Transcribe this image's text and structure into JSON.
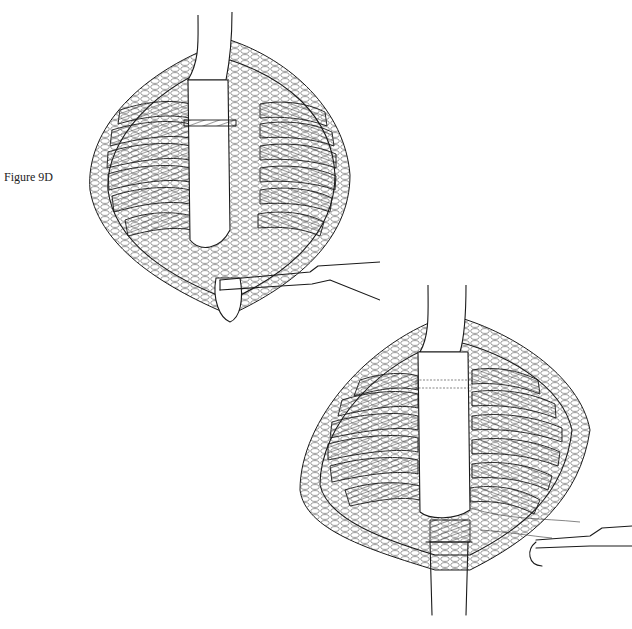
{
  "figure": {
    "caption": "Figure 9D",
    "panels": [
      {
        "id": "top",
        "description": "Open chest incision with rib cage, graft anastomosed at top, clamp at bottom"
      },
      {
        "id": "bottom",
        "description": "Open chest incision with completed graft, suture and needle holder at lower right"
      }
    ],
    "colors": {
      "line": "#1a1a1a",
      "background": "#ffffff"
    }
  }
}
